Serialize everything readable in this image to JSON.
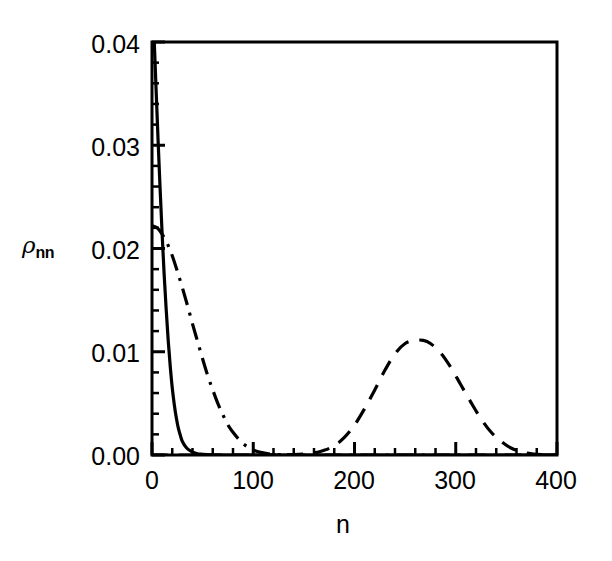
{
  "chart_data": {
    "type": "line",
    "title": "",
    "xlabel": "n",
    "ylabel": "ρ",
    "ylabel_sub": "nn",
    "xlim": [
      0,
      400
    ],
    "ylim": [
      0.0,
      0.04
    ],
    "grid": false,
    "legend": "none",
    "xticks": [
      0,
      100,
      200,
      300,
      400
    ],
    "xtick_labels": [
      "0",
      "100",
      "200",
      "300",
      "400"
    ],
    "yticks": [
      0.0,
      0.01,
      0.02,
      0.03,
      0.04
    ],
    "ytick_labels": [
      "0.00",
      "0.01",
      "0.02",
      "0.03",
      "0.04"
    ],
    "x_minor_step": 20,
    "y_minor_step": 0.002,
    "series": [
      {
        "name": "solid-narrow-decay",
        "linestyle": "solid",
        "color": "#000000",
        "x": [
          0,
          2,
          4,
          6,
          8,
          10,
          12,
          14,
          16,
          18,
          20,
          22,
          24,
          26,
          28,
          30,
          34,
          38,
          44,
          50,
          60,
          80,
          100,
          140,
          200,
          260,
          320,
          400
        ],
        "y": [
          0.0455,
          0.0406,
          0.0355,
          0.0305,
          0.0258,
          0.0214,
          0.0175,
          0.0141,
          0.0111,
          0.0086,
          0.0065,
          0.0049,
          0.0036,
          0.0026,
          0.0019,
          0.0013,
          0.0007,
          0.0004,
          0.00015,
          7e-05,
          2e-05,
          0.0,
          0.0,
          0.0,
          0.0,
          0.0,
          0.0,
          0.0
        ]
      },
      {
        "name": "dashdot-broad-decay",
        "linestyle": "dashdot",
        "color": "#000000",
        "x": [
          0,
          5,
          10,
          15,
          20,
          25,
          30,
          35,
          40,
          45,
          50,
          55,
          60,
          65,
          70,
          75,
          80,
          85,
          90,
          95,
          100,
          105,
          110,
          115,
          120,
          130,
          140,
          160,
          200,
          260,
          320,
          400
        ],
        "y": [
          0.0222,
          0.022,
          0.0214,
          0.0205,
          0.0193,
          0.0178,
          0.0162,
          0.0145,
          0.0127,
          0.011,
          0.0093,
          0.0077,
          0.0063,
          0.005,
          0.0039,
          0.0029,
          0.0022,
          0.0016,
          0.0011,
          0.00075,
          0.0005,
          0.00032,
          0.0002,
          0.00012,
          7e-05,
          2e-05,
          0.0,
          0.0,
          0.0,
          0.0,
          0.0,
          0.0
        ]
      },
      {
        "name": "dashed-gaussian-bump",
        "linestyle": "dashed",
        "color": "#000000",
        "x": [
          0,
          100,
          140,
          160,
          170,
          180,
          190,
          200,
          210,
          220,
          230,
          240,
          250,
          260,
          268,
          275,
          285,
          295,
          305,
          315,
          325,
          335,
          345,
          355,
          365,
          375,
          385,
          400
        ],
        "y": [
          0.0,
          0.0,
          5e-05,
          0.0002,
          0.00045,
          0.0009,
          0.0017,
          0.0029,
          0.0045,
          0.0063,
          0.0082,
          0.0098,
          0.0108,
          0.0111,
          0.0111,
          0.0108,
          0.0099,
          0.0085,
          0.0068,
          0.0051,
          0.0035,
          0.0022,
          0.0013,
          0.00065,
          0.0003,
          0.00012,
          4e-05,
          0.0
        ]
      }
    ]
  },
  "figure": {
    "frame_color": "#000000",
    "background": "#ffffff"
  }
}
